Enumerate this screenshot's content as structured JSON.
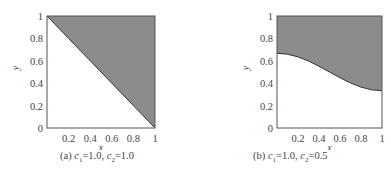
{
  "chart_data": [
    {
      "type": "area",
      "title": "",
      "caption": "(a) c1 = 1.0, c2 = 1.0",
      "caption_parts": {
        "label": "(a)",
        "c1_name": "c",
        "c1_sub": "1",
        "c1_val": "=1.0,",
        "c2_name": "c",
        "c2_sub": "2",
        "c2_val": "=1.0"
      },
      "xlabel": "x",
      "ylabel": "y",
      "xlim": [
        0,
        1
      ],
      "ylim": [
        0,
        1
      ],
      "xticks": [
        "0.2",
        "0.4",
        "0.6",
        "0.8",
        "1"
      ],
      "yticks": [
        "0",
        "0.2",
        "0.4",
        "0.6",
        "0.8",
        "1"
      ],
      "grid": false,
      "fill_color": "#8c8c8c",
      "boundary": {
        "x": [
          0,
          0.2,
          0.4,
          0.6,
          0.8,
          1.0
        ],
        "y": [
          1.0,
          0.8,
          0.6,
          0.4,
          0.2,
          0.0
        ]
      },
      "shaded_region": "above boundary"
    },
    {
      "type": "area",
      "title": "",
      "caption": "(b) c1 = 1.0, c2 = 0.5",
      "caption_parts": {
        "label": "(b)",
        "c1_name": "c",
        "c1_sub": "1",
        "c1_val": "=1.0,",
        "c2_name": "c",
        "c2_sub": "2",
        "c2_val": "=0.5"
      },
      "xlabel": "x",
      "ylabel": "y",
      "xlim": [
        0,
        1
      ],
      "ylim": [
        0,
        1
      ],
      "xticks": [
        "0.2",
        "0.4",
        "0.6",
        "0.8",
        "1"
      ],
      "yticks": [
        "0",
        "0.2",
        "0.4",
        "0.6",
        "0.8",
        "1"
      ],
      "grid": false,
      "fill_color": "#8c8c8c",
      "boundary": {
        "x": [
          0,
          0.1,
          0.2,
          0.3,
          0.4,
          0.5,
          0.6,
          0.7,
          0.8,
          0.9,
          1.0
        ],
        "y": [
          0.667,
          0.659,
          0.635,
          0.598,
          0.551,
          0.5,
          0.449,
          0.402,
          0.365,
          0.341,
          0.333
        ]
      },
      "shaded_region": "above boundary"
    }
  ]
}
